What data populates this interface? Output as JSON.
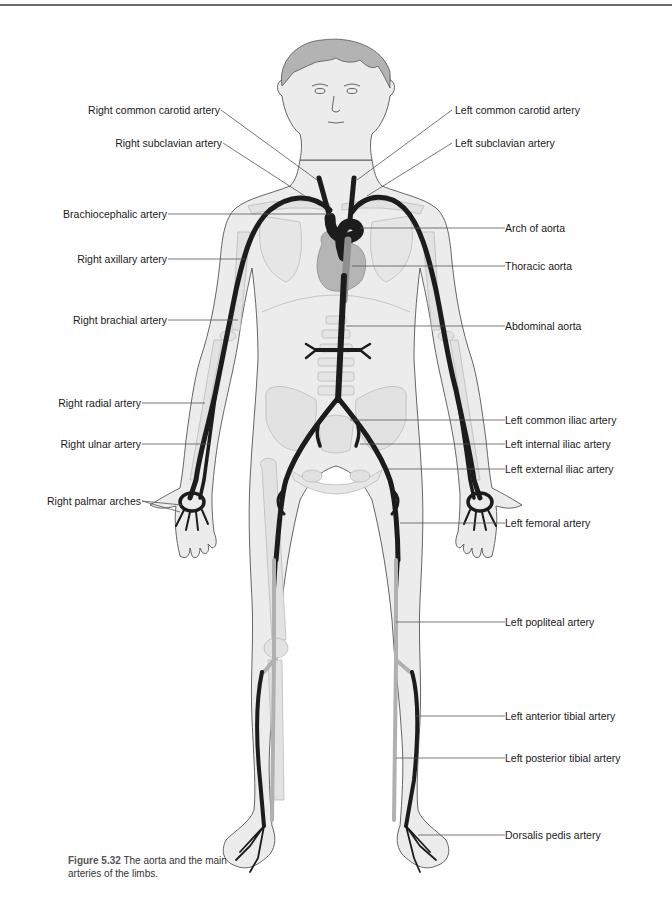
{
  "figure": {
    "caption_number": "Figure 5.32",
    "caption_text": "The aorta and the main arteries of the limbs."
  },
  "labels_right_side_of_body": [
    {
      "id": "right-common-carotid",
      "text": "Right common carotid artery"
    },
    {
      "id": "right-subclavian",
      "text": "Right subclavian artery"
    },
    {
      "id": "brachiocephalic",
      "text": "Brachiocephalic artery"
    },
    {
      "id": "right-axillary",
      "text": "Right axillary artery"
    },
    {
      "id": "right-brachial",
      "text": "Right brachial artery"
    },
    {
      "id": "right-radial",
      "text": "Right radial artery"
    },
    {
      "id": "right-ulnar",
      "text": "Right ulnar artery"
    },
    {
      "id": "right-palmar-arches",
      "text": "Right palmar arches"
    }
  ],
  "labels_left_side_of_body": [
    {
      "id": "left-common-carotid",
      "text": "Left common carotid artery"
    },
    {
      "id": "left-subclavian",
      "text": "Left subclavian artery"
    },
    {
      "id": "arch-of-aorta",
      "text": "Arch of aorta"
    },
    {
      "id": "thoracic-aorta",
      "text": "Thoracic aorta"
    },
    {
      "id": "abdominal-aorta",
      "text": "Abdominal aorta"
    },
    {
      "id": "left-common-iliac",
      "text": "Left common iliac artery"
    },
    {
      "id": "left-internal-iliac",
      "text": "Left internal iliac artery"
    },
    {
      "id": "left-external-iliac",
      "text": "Left external iliac artery"
    },
    {
      "id": "left-femoral",
      "text": "Left femoral artery"
    },
    {
      "id": "left-popliteal",
      "text": "Left popliteal artery"
    },
    {
      "id": "left-anterior-tibial",
      "text": "Left anterior tibial artery"
    },
    {
      "id": "left-posterior-tibial",
      "text": "Left posterior tibial artery"
    },
    {
      "id": "dorsalis-pedis",
      "text": "Dorsalis pedis artery"
    }
  ],
  "colors": {
    "body_fill": "#ececec",
    "body_outline": "#555555",
    "bone_fill": "#e2e2e2",
    "bone_outline": "#b8b8b8",
    "artery_dark": "#1c1c1c",
    "artery_posterior": "#b0b0b0",
    "heart": "#b5b5b5",
    "hair": "#b3b3b3",
    "leader_line": "#555555"
  }
}
